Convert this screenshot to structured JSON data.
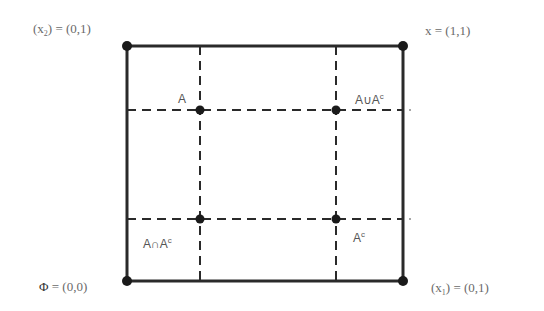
{
  "diagram": {
    "type": "lattice-square",
    "colors": {
      "line": "#2a2a2a",
      "text": "#6a6a6a",
      "background": "#ffffff"
    },
    "corners": {
      "top_left": {
        "var": "x",
        "sub": "2",
        "value": "(0,1)",
        "eq": "="
      },
      "top_right": {
        "var": "x",
        "value": "(1,1)",
        "eq": "="
      },
      "bottom_left": {
        "var": "Φ",
        "value": "(0,0)",
        "eq": "="
      },
      "bottom_right": {
        "var": "x",
        "sub": "1",
        "value": "(0,1)",
        "eq": "="
      }
    },
    "inner_points": {
      "A": {
        "text": "A"
      },
      "union": {
        "left": "A∪A",
        "sup": "c"
      },
      "intersection": {
        "left": "A∩A",
        "sup": "c"
      },
      "complement": {
        "left": "A",
        "sup": "c"
      }
    },
    "geometry": {
      "box": {
        "x1": 127,
        "y1": 46,
        "x2": 403,
        "y2": 281
      },
      "vdash_x": [
        200,
        336
      ],
      "hdash_y": [
        110,
        219
      ]
    }
  }
}
